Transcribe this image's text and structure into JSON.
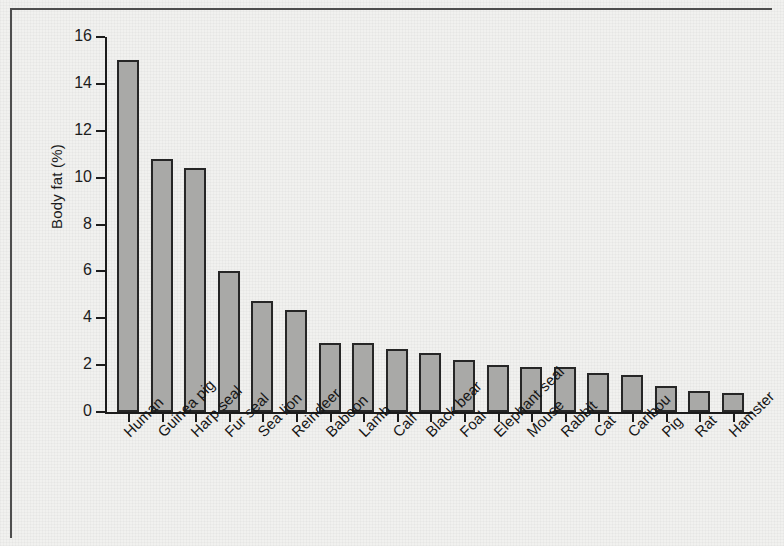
{
  "figure": {
    "background_color": "#f1f1ef",
    "frame_color": "#4e4e4e",
    "axis_color": "#1c1c1c",
    "bar_fill_color": "#a9a9a7",
    "bar_edge_color": "#262626"
  },
  "chart_data": {
    "type": "bar",
    "title": "",
    "xlabel": "",
    "ylabel": "Body fat (%)",
    "ylim": [
      0,
      16
    ],
    "ytick_labels": [
      "0",
      "2",
      "4",
      "6",
      "8",
      "10",
      "12",
      "14",
      "16"
    ],
    "ytick_values": [
      0,
      2,
      4,
      6,
      8,
      10,
      12,
      14,
      16
    ],
    "grid": false,
    "legend": null,
    "categories": [
      "Human",
      "Guinea pig",
      "Harp seal",
      "Fur seal",
      "Sea lion",
      "Reindeer",
      "Baboon",
      "Lamb",
      "Calf",
      "Black bear",
      "Foal",
      "Elephant seal",
      "Mouse",
      "Rabbit",
      "Cat",
      "Caribou",
      "Pig",
      "Rat",
      "Hamster"
    ],
    "values": [
      15.0,
      10.8,
      10.4,
      6.0,
      4.75,
      4.35,
      2.95,
      2.95,
      2.7,
      2.5,
      2.2,
      2.0,
      1.9,
      1.9,
      1.65,
      1.6,
      1.1,
      0.9,
      0.8
    ]
  }
}
